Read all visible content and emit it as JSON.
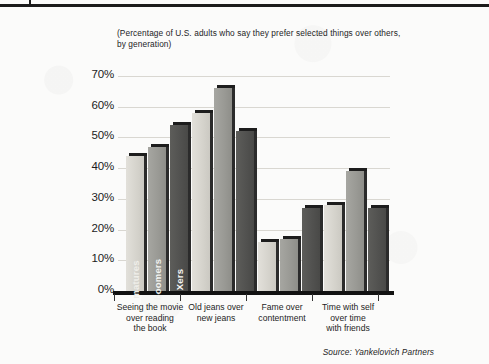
{
  "figure": {
    "subtitle": "(Percentage of U.S. adults who say they prefer selected things over others, by generation)",
    "source": "Source: Yankelovich Partners"
  },
  "chart_data": {
    "type": "bar",
    "title": "",
    "subtitle": "(Percentage of U.S. adults who say they prefer selected things over others, by generation)",
    "xlabel": "",
    "ylabel": "",
    "ylim": [
      0,
      70
    ],
    "ytick_labels": [
      "70%",
      "60%",
      "50%",
      "40%",
      "30%",
      "20%",
      "10%",
      "0%"
    ],
    "ytick_values": [
      70,
      60,
      50,
      40,
      30,
      20,
      10,
      0
    ],
    "grid": true,
    "legend_position": "inside-first-group-rotated",
    "categories": [
      "Seeing the movie over reading the book",
      "Old jeans over new jeans",
      "Fame over contentment",
      "Time with self over time with friends"
    ],
    "category_lines": [
      [
        "Seeing the movie",
        "over reading",
        "the book"
      ],
      [
        "Old jeans over",
        "new jeans"
      ],
      [
        "Fame over",
        "contentment"
      ],
      [
        "Time with self",
        "over time",
        "with friends"
      ]
    ],
    "series": [
      {
        "name": "matures",
        "color": "#d6d4cd",
        "values": [
          44,
          58,
          16,
          28
        ]
      },
      {
        "name": "boomers",
        "color": "#9a9a95",
        "values": [
          47,
          66,
          17,
          39
        ]
      },
      {
        "name": "Xers",
        "color": "#525250",
        "values": [
          54,
          52,
          27,
          27
        ]
      }
    ],
    "source": "Source: Yankelovich Partners"
  }
}
